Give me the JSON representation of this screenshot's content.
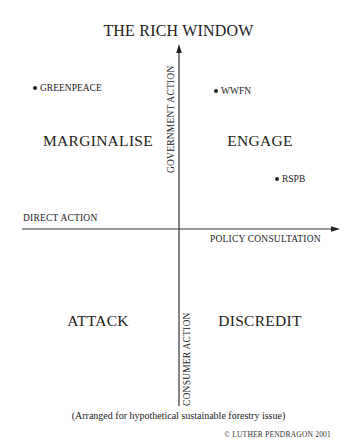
{
  "diagram": {
    "title": "THE RICH WINDOW",
    "axes": {
      "vertical_top_label": "GOVERNMENT ACTION",
      "vertical_bottom_label": "CONSUMER ACTION",
      "horizontal_left_label": "DIRECT ACTION",
      "horizontal_right_label": "POLICY CONSULTATION"
    },
    "quadrants": {
      "top_left": "MARGINALISE",
      "top_right": "ENGAGE",
      "bottom_left": "ATTACK",
      "bottom_right": "DISCREDIT"
    },
    "organisations": [
      {
        "label": "GREENPEACE",
        "quadrant": "top_left"
      },
      {
        "label": "WWFN",
        "quadrant": "top_right"
      },
      {
        "label": "RSPB",
        "quadrant": "top_right"
      }
    ],
    "caption": "(Arranged for hypothetical sustainable forestry issue)",
    "copyright": "© LUTHER PENDRAGON 2001",
    "colors": {
      "ink": "#222222",
      "background": "#ffffff"
    }
  }
}
